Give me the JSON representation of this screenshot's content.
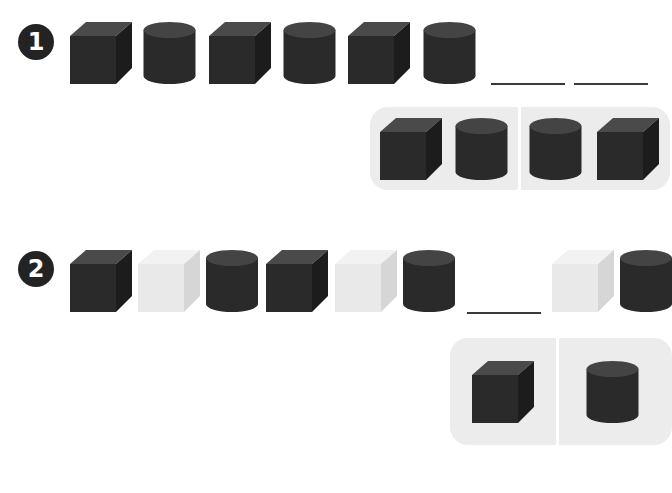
{
  "colors": {
    "dark_front": "#2a2a2a",
    "dark_top": "#4a4a4a",
    "dark_side": "#1c1c1c",
    "light_front": "#e9e9e9",
    "light_top": "#f2f2f2",
    "light_side": "#d6d6d6",
    "answer_bg": "#ececec",
    "blank_line": "#3a3a3a"
  },
  "problems": [
    {
      "number": "1",
      "sequence": [
        "dark-cube",
        "dark-cylinder",
        "dark-cube",
        "dark-cylinder",
        "dark-cube",
        "dark-cylinder"
      ],
      "blanks": 2,
      "answer_options": [
        [
          "dark-cube",
          "dark-cylinder"
        ],
        [
          "dark-cylinder",
          "dark-cube"
        ]
      ]
    },
    {
      "number": "2",
      "sequence": [
        "dark-cube",
        "light-cube",
        "dark-cylinder",
        "dark-cube",
        "light-cube",
        "dark-cylinder",
        "blank",
        "light-cube",
        "dark-cylinder"
      ],
      "blanks": 1,
      "answer_options": [
        [
          "dark-cube"
        ],
        [
          "dark-cylinder"
        ]
      ]
    }
  ]
}
